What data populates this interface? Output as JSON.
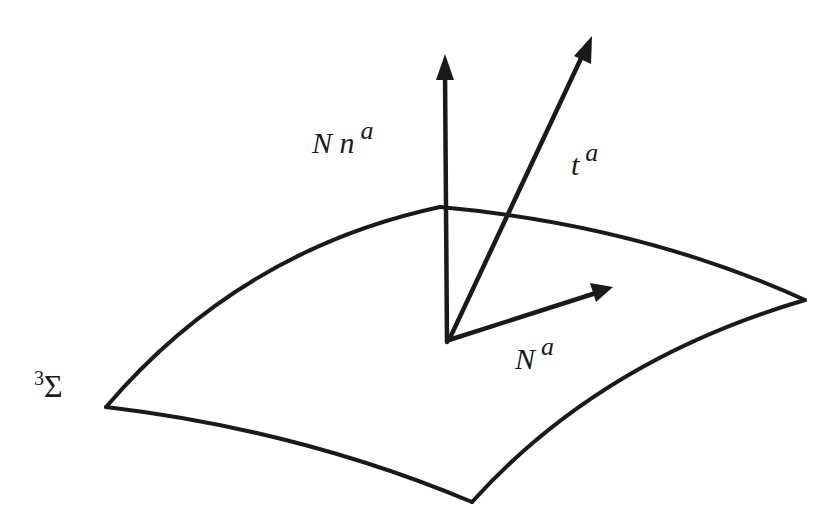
{
  "diagram": {
    "type": "hypersurface-vector-decomposition",
    "background_color": "#ffffff",
    "stroke_color": "#1a1a1a",
    "surface": {
      "label_prefix": "3",
      "label_symbol": "Σ",
      "corners": {
        "left": [
          106,
          407
        ],
        "top": [
          440,
          207
        ],
        "right": [
          805,
          300
        ],
        "bottom": [
          472,
          502
        ]
      }
    },
    "origin": [
      447,
      342
    ],
    "vectors": [
      {
        "id": "shift-normal",
        "label_main": "N n",
        "label_sup": "a",
        "tip": [
          445,
          55
        ]
      },
      {
        "id": "time-vector",
        "label_main": "t",
        "label_sup": "a",
        "tip": [
          592,
          36
        ]
      },
      {
        "id": "shift-vector",
        "label_main": "N",
        "label_sup": "a",
        "tip": [
          612,
          288
        ]
      }
    ]
  }
}
